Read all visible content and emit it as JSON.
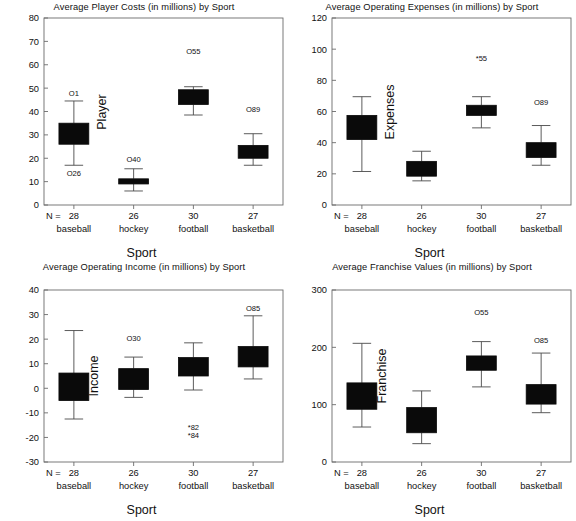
{
  "figure": {
    "panel_count": 4,
    "background_color": "#ffffff",
    "box_color": "#0a0a0a",
    "axis_color": "#6b6b6b"
  },
  "panels": [
    {
      "key": "player_costs",
      "title": "Average Player Costs (in millions) by Sport",
      "ylabel": "Player",
      "xlabel": "Sport",
      "n_prefix": "N ="
    },
    {
      "key": "operating_expenses",
      "title": "Average Operating Expenses (in millions) by Sport",
      "ylabel": "Expenses",
      "xlabel": "Sport",
      "n_prefix": "N ="
    },
    {
      "key": "operating_income",
      "title": "Average Operating Income (in millions) by Sport",
      "ylabel": "Income",
      "xlabel": "Sport",
      "n_prefix": "N ="
    },
    {
      "key": "franchise_values",
      "title": "Average Franchise Values (in millions) by Sport",
      "ylabel": "Franchise",
      "xlabel": "Sport",
      "n_prefix": "N ="
    }
  ],
  "chart_data": [
    {
      "type": "box",
      "key": "player_costs",
      "title": "Average Player Costs (in millions) by Sport",
      "xlabel": "Sport",
      "ylabel": "Player",
      "ylim": [
        0,
        80
      ],
      "yticks": [
        0,
        10,
        20,
        30,
        40,
        50,
        60,
        70,
        80
      ],
      "ytick_labels": [
        "0",
        "10",
        "20",
        "30",
        "40",
        "50",
        "60",
        "70",
        "80"
      ],
      "grid": false,
      "categories": [
        "baseball",
        "hockey",
        "football",
        "basketball"
      ],
      "counts": [
        28,
        26,
        30,
        27
      ],
      "count_labels": [
        "28",
        "26",
        "30",
        "27"
      ],
      "boxes": [
        {
          "category": "baseball",
          "whisker_low": 17.0,
          "q1": 26.0,
          "median": 31.0,
          "q3": 35.0,
          "whisker_high": 44.5
        },
        {
          "category": "hockey",
          "whisker_low": 6.0,
          "q1": 9.0,
          "median": 10.2,
          "q3": 11.2,
          "whisker_high": 15.5
        },
        {
          "category": "football",
          "whisker_low": 38.5,
          "q1": 43.0,
          "median": 46.0,
          "q3": 49.3,
          "whisker_high": 50.6
        },
        {
          "category": "basketball",
          "whisker_low": 17.0,
          "q1": 20.0,
          "median": 22.5,
          "q3": 25.5,
          "whisker_high": 30.5
        }
      ],
      "markers": [
        {
          "category": "baseball",
          "symbol": "circle",
          "label": "O1",
          "id": "1",
          "value": 48.0
        },
        {
          "category": "baseball",
          "symbol": "circle",
          "label": "O26",
          "id": "26",
          "value": 13.5
        },
        {
          "category": "hockey",
          "symbol": "circle",
          "label": "O40",
          "id": "40",
          "value": 19.5
        },
        {
          "category": "football",
          "symbol": "circle",
          "label": "O55",
          "id": "55",
          "value": 66.0
        },
        {
          "category": "basketball",
          "symbol": "circle",
          "label": "O89",
          "id": "89",
          "value": 41.0
        }
      ]
    },
    {
      "type": "box",
      "key": "operating_expenses",
      "title": "Average Operating Expenses (in millions) by Sport",
      "xlabel": "Sport",
      "ylabel": "Expenses",
      "ylim": [
        0,
        120
      ],
      "yticks": [
        0,
        20,
        40,
        60,
        80,
        100,
        120
      ],
      "ytick_labels": [
        "0",
        "20",
        "40",
        "60",
        "80",
        "100",
        "120"
      ],
      "grid": false,
      "categories": [
        "baseball",
        "hockey",
        "football",
        "basketball"
      ],
      "counts": [
        28,
        26,
        30,
        27
      ],
      "count_labels": [
        "28",
        "26",
        "30",
        "27"
      ],
      "boxes": [
        {
          "category": "baseball",
          "whisker_low": 21.5,
          "q1": 42.0,
          "median": 49.0,
          "q3": 57.5,
          "whisker_high": 69.5
        },
        {
          "category": "hockey",
          "whisker_low": 15.5,
          "q1": 18.5,
          "median": 21.5,
          "q3": 28.0,
          "whisker_high": 34.5
        },
        {
          "category": "football",
          "whisker_low": 49.5,
          "q1": 57.5,
          "median": 61.0,
          "q3": 64.0,
          "whisker_high": 69.5
        },
        {
          "category": "basketball",
          "whisker_low": 25.5,
          "q1": 30.5,
          "median": 35.0,
          "q3": 40.0,
          "whisker_high": 51.0
        }
      ],
      "markers": [
        {
          "category": "football",
          "symbol": "asterisk",
          "label": "*55",
          "id": "55",
          "value": 94.0
        },
        {
          "category": "basketball",
          "symbol": "circle",
          "label": "O89",
          "id": "89",
          "value": 66.0
        }
      ]
    },
    {
      "type": "box",
      "key": "operating_income",
      "title": "Average Operating Income (in millions) by Sport",
      "xlabel": "Sport",
      "ylabel": "Income",
      "ylim": [
        -30,
        40
      ],
      "yticks": [
        -30,
        -20,
        -10,
        0,
        10,
        20,
        30,
        40
      ],
      "ytick_labels": [
        "-30",
        "-20",
        "-10",
        "0",
        "10",
        "20",
        "30",
        "40"
      ],
      "grid": false,
      "categories": [
        "baseball",
        "hockey",
        "football",
        "basketball"
      ],
      "counts": [
        28,
        26,
        30,
        27
      ],
      "count_labels": [
        "28",
        "26",
        "30",
        "27"
      ],
      "boxes": [
        {
          "category": "baseball",
          "whisker_low": -12.5,
          "q1": -5.0,
          "median": 0.8,
          "q3": 6.2,
          "whisker_high": 23.5
        },
        {
          "category": "hockey",
          "whisker_low": -3.7,
          "q1": -0.5,
          "median": 4.0,
          "q3": 8.0,
          "whisker_high": 12.7
        },
        {
          "category": "football",
          "whisker_low": -0.7,
          "q1": 5.0,
          "median": 9.5,
          "q3": 12.5,
          "whisker_high": 18.5
        },
        {
          "category": "basketball",
          "whisker_low": 3.8,
          "q1": 8.7,
          "median": 12.0,
          "q3": 17.0,
          "whisker_high": 29.5
        }
      ],
      "markers": [
        {
          "category": "hockey",
          "symbol": "circle",
          "label": "O30",
          "id": "30",
          "value": 20.5
        },
        {
          "category": "football",
          "symbol": "asterisk",
          "label": "*82",
          "id": "82",
          "value": -16.0
        },
        {
          "category": "football",
          "symbol": "asterisk",
          "label": "*84",
          "id": "84",
          "value": -19.0
        },
        {
          "category": "basketball",
          "symbol": "circle",
          "label": "O85",
          "id": "85",
          "value": 32.5
        }
      ]
    },
    {
      "type": "box",
      "key": "franchise_values",
      "title": "Average Franchise Values (in millions) by Sport",
      "xlabel": "Sport",
      "ylabel": "Franchise",
      "ylim": [
        0,
        300
      ],
      "yticks": [
        0,
        100,
        200,
        300
      ],
      "ytick_labels": [
        "0",
        "100",
        "200",
        "300"
      ],
      "grid": false,
      "categories": [
        "baseball",
        "hockey",
        "football",
        "basketball"
      ],
      "counts": [
        28,
        26,
        30,
        27
      ],
      "count_labels": [
        "28",
        "26",
        "30",
        "27"
      ],
      "boxes": [
        {
          "category": "baseball",
          "whisker_low": 61.0,
          "q1": 92.0,
          "median": 113.0,
          "q3": 138.0,
          "whisker_high": 207.0
        },
        {
          "category": "hockey",
          "whisker_low": 32.0,
          "q1": 51.0,
          "median": 72.0,
          "q3": 95.0,
          "whisker_high": 124.0
        },
        {
          "category": "football",
          "whisker_low": 131.0,
          "q1": 160.0,
          "median": 172.0,
          "q3": 185.0,
          "whisker_high": 210.0
        },
        {
          "category": "basketball",
          "whisker_low": 86.0,
          "q1": 101.0,
          "median": 117.0,
          "q3": 135.0,
          "whisker_high": 190.0
        }
      ],
      "markers": [
        {
          "category": "football",
          "symbol": "circle",
          "label": "O55",
          "id": "55",
          "value": 262.0
        },
        {
          "category": "basketball",
          "symbol": "circle",
          "label": "O85",
          "id": "85",
          "value": 212.0
        }
      ]
    }
  ]
}
